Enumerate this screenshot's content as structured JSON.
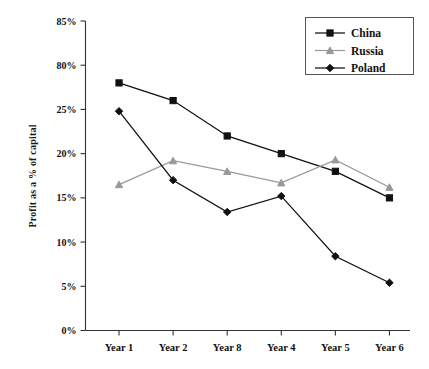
{
  "chart_data": {
    "type": "line",
    "title": "",
    "xlabel": "",
    "ylabel": "Profit as a % of capital",
    "categories": [
      "Year 1",
      "Year 2",
      "Year 8",
      "Year 4",
      "Year 5",
      "Year 6"
    ],
    "ylim": [
      0,
      35
    ],
    "ytick_labels": [
      "0%",
      "5%",
      "10%",
      "15%",
      "20%",
      "25%",
      "80%",
      "85%"
    ],
    "ytick_values": [
      0,
      5,
      10,
      15,
      20,
      25,
      30,
      35
    ],
    "grid": false,
    "legend_position": "top-right",
    "series": [
      {
        "name": "China",
        "color": "#111111",
        "marker": "square",
        "values": [
          28.0,
          26.0,
          22.0,
          20.0,
          18.0,
          15.0
        ]
      },
      {
        "name": "Russia",
        "color": "#999999",
        "marker": "triangle",
        "values": [
          16.5,
          19.2,
          18.0,
          16.7,
          19.3,
          16.2
        ]
      },
      {
        "name": "Poland",
        "color": "#111111",
        "marker": "diamond",
        "values": [
          24.8,
          17.0,
          13.4,
          15.2,
          8.4,
          5.4
        ]
      }
    ]
  },
  "legend": {
    "items": [
      {
        "label": "China"
      },
      {
        "label": "Russia"
      },
      {
        "label": "Poland"
      }
    ]
  },
  "axes": {
    "y_title": "Profit as a % of capital"
  }
}
